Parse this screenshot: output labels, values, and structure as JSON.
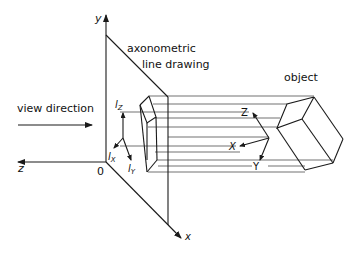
{
  "labels": {
    "y_axis": "y",
    "z_axis": "z",
    "x_axis": "x",
    "origin": "0",
    "plane_title_line1": "axonometric",
    "plane_title_line2": "line drawing",
    "view_direction": "view direction",
    "object": "object",
    "lz": "l",
    "lz_sub": "Z",
    "lx": "l",
    "lx_sub": "X",
    "ly": "l",
    "ly_sub": "Y",
    "obj_Z": "Z",
    "obj_X": "X",
    "obj_Y": "Y"
  },
  "colors": {
    "ink": "#1a1a1a",
    "background": "#ffffff"
  }
}
